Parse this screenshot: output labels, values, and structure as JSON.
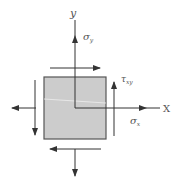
{
  "diagram": {
    "axes": {
      "x_label": "X",
      "y_label": "y"
    },
    "labels": {
      "sigma_y": "σ",
      "sigma_y_sub": "y",
      "sigma_x": "σ",
      "sigma_x_sub": "x",
      "tau_xy": "τ",
      "tau_xy_sub": "xy"
    },
    "colors": {
      "element_fill": "#cccccc",
      "element_stroke": "#444444",
      "line": "#333333",
      "text": "#555555"
    }
  }
}
